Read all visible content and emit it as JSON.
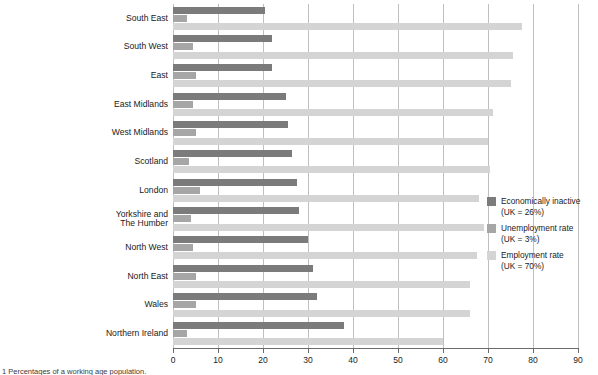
{
  "chart_data": {
    "type": "bar",
    "orientation": "horizontal",
    "title": "",
    "xlabel": "",
    "ylabel": "",
    "xlim": [
      0,
      90
    ],
    "xticks": [
      0,
      10,
      20,
      30,
      40,
      50,
      60,
      70,
      80,
      90
    ],
    "grid": true,
    "legend_position": "right",
    "categories": [
      "South East",
      "South West",
      "East",
      "East Midlands",
      "West Midlands",
      "Scotland",
      "London",
      "Yorkshire and\nThe Humber",
      "North West",
      "North East",
      "Wales",
      "Northern Ireland"
    ],
    "series": [
      {
        "name": "Economically inactive",
        "uk_value_label": "(UK = 26%)",
        "color": "#7b7b7b",
        "values": [
          20.5,
          22,
          22,
          25,
          25.5,
          26.5,
          27.5,
          28,
          30,
          31,
          32,
          38
        ]
      },
      {
        "name": "Unemployment rate",
        "uk_value_label": "(UK = 3%)",
        "color": "#a6a6a6",
        "values": [
          3,
          4.5,
          5,
          4.5,
          5,
          3.5,
          6,
          4,
          4.5,
          5,
          5,
          3
        ]
      },
      {
        "name": "Employment rate",
        "uk_value_label": "(UK = 70%)",
        "color": "#d4d4d4",
        "values": [
          77.5,
          75.5,
          75,
          71,
          70,
          70.5,
          68,
          69,
          67.5,
          66,
          66,
          60
        ]
      }
    ]
  },
  "legend": {
    "items": [
      {
        "label": "Economically inactive",
        "sub": "(UK = 26%)",
        "color": "#7b7b7b",
        "icon": "legend-swatch-inactive"
      },
      {
        "label": "Unemployment rate",
        "sub": "(UK = 3%)",
        "color": "#a6a6a6",
        "icon": "legend-swatch-unemployment"
      },
      {
        "label": "Employment rate",
        "sub": "(UK = 70%)",
        "color": "#d4d4d4",
        "icon": "legend-swatch-employment"
      }
    ]
  },
  "footnote": "1 Percentages of a working age population.",
  "colors": {
    "grid": "#bfbfbf",
    "axis": "#6b6b6b",
    "text": "#1a1a1a",
    "background": "#ffffff"
  }
}
